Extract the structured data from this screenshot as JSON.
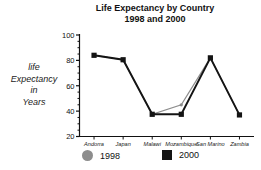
{
  "chart_data": {
    "type": "line",
    "title": "Life Expectancy by Country",
    "subtitle": "1998 and 2000",
    "title_lines": [
      "Life Expectancy by Country",
      "1998 and 2000"
    ],
    "xlabel": "",
    "ylabel": "life Expectancy in Years",
    "ylabel_lines": [
      "life",
      "Expectancy",
      "in",
      "Years"
    ],
    "categories": [
      "Andorra",
      "Japan",
      "Malawi",
      "Mozambique",
      "San Marino",
      "Zambia"
    ],
    "series": [
      {
        "name": "1998",
        "color": "#8d8d8d",
        "marker": "circle",
        "values": [
          84,
          80.5,
          37.5,
          45,
          82,
          37
        ]
      },
      {
        "name": "2000",
        "color": "#141414",
        "marker": "square",
        "values": [
          84,
          80.5,
          37.5,
          37.5,
          82,
          37
        ]
      }
    ],
    "ylim": [
      20,
      100
    ],
    "yticks": [
      20,
      40,
      60,
      80,
      100
    ],
    "ytick_labels": [
      "20",
      "40",
      "60",
      "80",
      "100"
    ],
    "y_minor_tick_step": 5,
    "grid": false,
    "legend_position": "bottom"
  },
  "legend": {
    "items": [
      {
        "label": "1998",
        "marker": "circle-marker",
        "color": "#8d8d8d"
      },
      {
        "label": "2000",
        "marker": "square-marker",
        "color": "#141414"
      }
    ]
  }
}
